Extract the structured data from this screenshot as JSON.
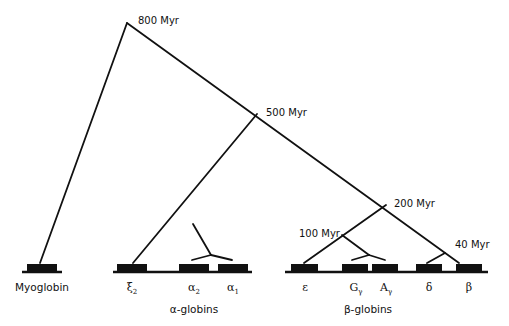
{
  "diagram": {
    "type": "phylogenetic-tree",
    "colors": {
      "line": "#111111",
      "background": "#ffffff"
    },
    "nodes": [
      {
        "id": "n800",
        "label": "800 Myr"
      },
      {
        "id": "n500",
        "label": "500 Myr"
      },
      {
        "id": "n200",
        "label": "200 Myr"
      },
      {
        "id": "n100",
        "label": "100 Myr"
      },
      {
        "id": "n40",
        "label": "40 Myr"
      }
    ],
    "genes": {
      "myoglobin": {
        "label": "Myoglobin"
      },
      "xi2": {
        "symbol": "ξ",
        "sub": "2"
      },
      "alpha2": {
        "symbol": "α",
        "sub": "2"
      },
      "alpha1": {
        "symbol": "α",
        "sub": "1"
      },
      "epsilon": {
        "symbol": "ε",
        "sub": ""
      },
      "gGamma": {
        "symbol": "G",
        "sub": "γ"
      },
      "aGamma": {
        "symbol": "A",
        "sub": "γ"
      },
      "delta": {
        "symbol": "δ",
        "sub": ""
      },
      "beta": {
        "symbol": "β",
        "sub": ""
      }
    },
    "clusters": {
      "alpha": {
        "label": "α-globins"
      },
      "beta": {
        "label": "β-globins"
      }
    }
  }
}
